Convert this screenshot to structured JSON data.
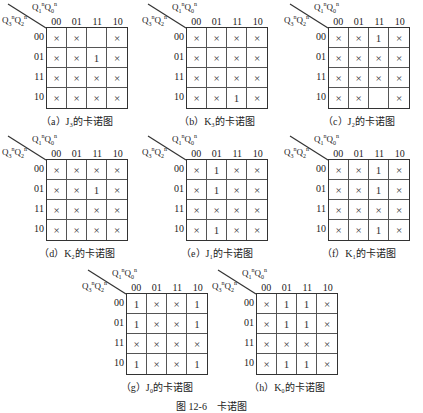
{
  "header": {
    "col_vars": "Q1nQ0n",
    "row_vars": "Q3nQ2n",
    "col_labels": [
      "00",
      "01",
      "11",
      "10"
    ],
    "row_labels": [
      "00",
      "01",
      "11",
      "10"
    ]
  },
  "maps": [
    {
      "id": "a",
      "caption": "（a）J₃的卡诺图",
      "cells": [
        [
          "×",
          "×",
          "",
          "×"
        ],
        [
          "×",
          "×",
          "1",
          "×"
        ],
        [
          "×",
          "×",
          "×",
          "×"
        ],
        [
          "×",
          "×",
          "×",
          "×"
        ]
      ]
    },
    {
      "id": "b",
      "caption": "（b）K₃的卡诺图",
      "cells": [
        [
          "×",
          "×",
          "×",
          "×"
        ],
        [
          "×",
          "×",
          "×",
          "×"
        ],
        [
          "×",
          "×",
          "×",
          "×"
        ],
        [
          "×",
          "×",
          "1",
          "×"
        ]
      ]
    },
    {
      "id": "c",
      "caption": "（c）J₂的卡诺图",
      "cells": [
        [
          "×",
          "×",
          "1",
          "×"
        ],
        [
          "×",
          "×",
          "×",
          "×"
        ],
        [
          "×",
          "×",
          "×",
          "×"
        ],
        [
          "×",
          "×",
          "",
          "×"
        ]
      ]
    },
    {
      "id": "d",
      "caption": "（d）K₂的卡诺图",
      "cells": [
        [
          "×",
          "×",
          "×",
          "×"
        ],
        [
          "×",
          "×",
          "1",
          "×"
        ],
        [
          "×",
          "×",
          "×",
          "×"
        ],
        [
          "×",
          "×",
          "×",
          "×"
        ]
      ]
    },
    {
      "id": "e",
      "caption": "（e）J₁的卡诺图",
      "cells": [
        [
          "×",
          "1",
          "×",
          "×"
        ],
        [
          "×",
          "1",
          "×",
          "×"
        ],
        [
          "×",
          "×",
          "×",
          "×"
        ],
        [
          "×",
          "1",
          "×",
          "×"
        ]
      ]
    },
    {
      "id": "f",
      "caption": "（f）K₁的卡诺图",
      "cells": [
        [
          "×",
          "×",
          "1",
          "×"
        ],
        [
          "×",
          "×",
          "1",
          "×"
        ],
        [
          "×",
          "×",
          "×",
          "×"
        ],
        [
          "×",
          "×",
          "1",
          "×"
        ]
      ]
    },
    {
      "id": "g",
      "caption": "（g）J₀的卡诺图",
      "cells": [
        [
          "1",
          "×",
          "×",
          "1"
        ],
        [
          "1",
          "×",
          "×",
          "1"
        ],
        [
          "×",
          "×",
          "×",
          "×"
        ],
        [
          "1",
          "×",
          "×",
          "1"
        ]
      ]
    },
    {
      "id": "h",
      "caption": "（h）K₀的卡诺图",
      "cells": [
        [
          "×",
          "1",
          "1",
          "×"
        ],
        [
          "×",
          "1",
          "1",
          "×"
        ],
        [
          "×",
          "×",
          "×",
          "×"
        ],
        [
          "×",
          "1",
          "1",
          "×"
        ]
      ]
    }
  ],
  "figure_caption": "图 12-6　卡诺图"
}
